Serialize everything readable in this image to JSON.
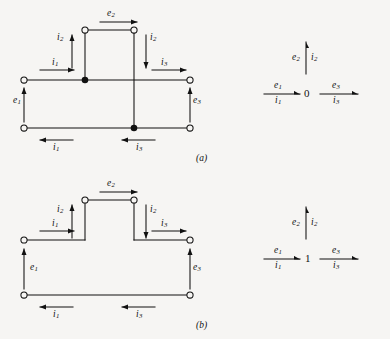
{
  "figure": {
    "background_color": "#f6f5f3",
    "ink_color": "#111111",
    "panels": [
      {
        "caption": "(a)",
        "circuit": {
          "name": "parallel-connection-circuit",
          "junction_type": "parallel",
          "terminals": 6,
          "node_dots": 2,
          "labels": {
            "e1": "e",
            "e1_sub": "1",
            "e2": "e",
            "e2_sub": "2",
            "e3": "e",
            "e3_sub": "3",
            "i1_top": "i",
            "i1_top_sub": "1",
            "i1_bot": "i",
            "i1_bot_sub": "1",
            "i2_left": "i",
            "i2_left_sub": "2",
            "i2_right": "i",
            "i2_right_sub": "2",
            "i3_top": "i",
            "i3_top_sub": "3",
            "i3_bot": "i",
            "i3_bot_sub": "3"
          }
        },
        "bond_graph": {
          "name": "zero-junction",
          "junction_symbol": "0",
          "bonds": [
            {
              "name": "bond-1",
              "effort": "e",
              "effort_sub": "1",
              "flow": "i",
              "flow_sub": "1",
              "direction": "into-junction",
              "side": "left"
            },
            {
              "name": "bond-2",
              "effort": "e",
              "effort_sub": "2",
              "flow": "i",
              "flow_sub": "2",
              "direction": "out-of-junction",
              "side": "top"
            },
            {
              "name": "bond-3",
              "effort": "e",
              "effort_sub": "3",
              "flow": "i",
              "flow_sub": "3",
              "direction": "out-of-junction",
              "side": "right"
            }
          ]
        }
      },
      {
        "caption": "(b)",
        "circuit": {
          "name": "series-connection-circuit",
          "junction_type": "series",
          "terminals": 6,
          "node_dots": 0,
          "labels": {
            "e1": "e",
            "e1_sub": "1",
            "e2": "e",
            "e2_sub": "2",
            "e3": "e",
            "e3_sub": "3",
            "i1_top": "i",
            "i1_top_sub": "1",
            "i1_bot": "i",
            "i1_bot_sub": "1",
            "i2_left": "i",
            "i2_left_sub": "2",
            "i2_right": "i",
            "i2_right_sub": "2",
            "i3_top": "i",
            "i3_top_sub": "3",
            "i3_bot": "i",
            "i3_bot_sub": "3"
          }
        },
        "bond_graph": {
          "name": "one-junction",
          "junction_symbol": "1",
          "bonds": [
            {
              "name": "bond-1",
              "effort": "e",
              "effort_sub": "1",
              "flow": "i",
              "flow_sub": "1",
              "direction": "into-junction",
              "side": "left"
            },
            {
              "name": "bond-2",
              "effort": "e",
              "effort_sub": "2",
              "flow": "i",
              "flow_sub": "2",
              "direction": "out-of-junction",
              "side": "top"
            },
            {
              "name": "bond-3",
              "effort": "e",
              "effort_sub": "3",
              "flow": "i",
              "flow_sub": "3",
              "direction": "out-of-junction",
              "side": "right"
            }
          ]
        }
      }
    ]
  }
}
